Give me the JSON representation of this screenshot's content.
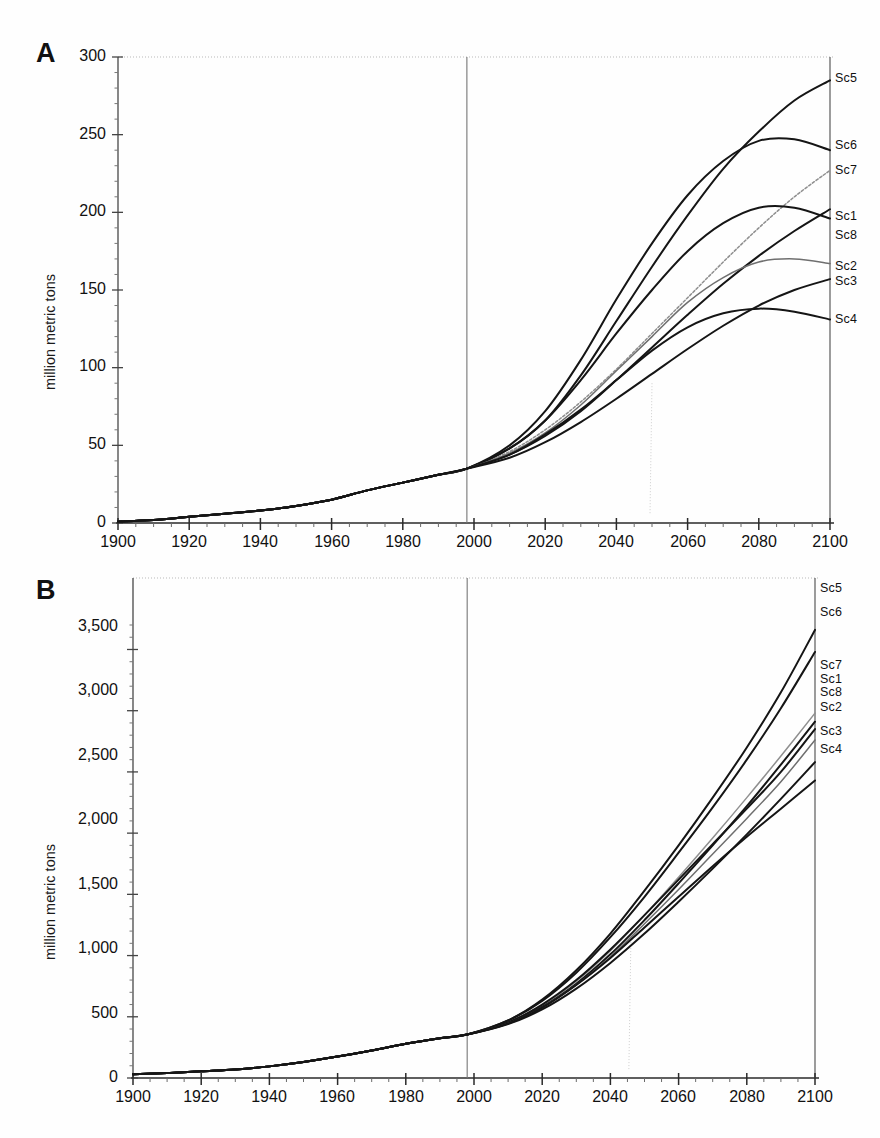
{
  "figure": {
    "panels": [
      {
        "letter": "A",
        "ylabel": "million metric tons",
        "yticks": [
          "0",
          "50",
          "100",
          "150",
          "200",
          "250",
          "300"
        ],
        "xticks": [
          "1900",
          "1920",
          "1940",
          "1960",
          "1980",
          "2000",
          "2020",
          "2040",
          "2060",
          "2080",
          "2100"
        ],
        "series_labels": [
          "Sc5",
          "Sc6",
          "Sc7",
          "Sc1",
          "Sc8",
          "Sc2",
          "Sc3",
          "Sc4"
        ]
      },
      {
        "letter": "B",
        "ylabel": "million metric tons",
        "yticks": [
          "0",
          "500",
          "1,000",
          "1,500",
          "2,000",
          "2,500",
          "3,000",
          "3,500"
        ],
        "xticks": [
          "1900",
          "1920",
          "1940",
          "1960",
          "1980",
          "2000",
          "2020",
          "2040",
          "2060",
          "2080",
          "2100"
        ],
        "series_labels": [
          "Sc5",
          "Sc6",
          "Sc7",
          "Sc1",
          "Sc8",
          "Sc2",
          "Sc3",
          "Sc4"
        ]
      }
    ]
  },
  "chart_data": [
    {
      "type": "line",
      "panel": "A",
      "title": "",
      "xlabel": "",
      "ylabel": "million metric tons",
      "xlim": [
        1900,
        2100
      ],
      "ylim": [
        0,
        300
      ],
      "ytick_values": [
        0,
        50,
        100,
        150,
        200,
        250,
        300
      ],
      "xtick_values": [
        1900,
        1920,
        1940,
        1960,
        1980,
        2000,
        2020,
        2040,
        2060,
        2080,
        2100
      ],
      "minor_tick_interval": 5,
      "grid": false,
      "legend_position": "right-end-of-line",
      "annotations": [
        {
          "text": "vertical reference line at base year",
          "x": 1998
        }
      ],
      "x": [
        1900,
        1910,
        1920,
        1930,
        1940,
        1950,
        1960,
        1970,
        1980,
        1990,
        1998,
        2010,
        2020,
        2030,
        2040,
        2050,
        2060,
        2070,
        2080,
        2090,
        2100
      ],
      "series": [
        {
          "name": "Sc5",
          "values": [
            1,
            2,
            4,
            6,
            8,
            11,
            15,
            21,
            26,
            31,
            35,
            48,
            66,
            95,
            130,
            165,
            198,
            228,
            252,
            272,
            285
          ]
        },
        {
          "name": "Sc6",
          "values": [
            1,
            2,
            4,
            6,
            8,
            11,
            15,
            21,
            26,
            31,
            35,
            50,
            72,
            105,
            144,
            180,
            211,
            233,
            246,
            247,
            240
          ]
        },
        {
          "name": "Sc7",
          "values": [
            1,
            2,
            4,
            6,
            8,
            11,
            15,
            21,
            26,
            31,
            35,
            46,
            60,
            78,
            99,
            122,
            145,
            168,
            190,
            210,
            227
          ]
        },
        {
          "name": "Sc1",
          "values": [
            1,
            2,
            4,
            6,
            8,
            11,
            15,
            21,
            26,
            31,
            35,
            44,
            56,
            72,
            92,
            113,
            134,
            154,
            172,
            188,
            202
          ]
        },
        {
          "name": "Sc8",
          "values": [
            1,
            2,
            4,
            6,
            8,
            11,
            15,
            21,
            26,
            31,
            35,
            48,
            66,
            92,
            122,
            150,
            175,
            193,
            203,
            203,
            196
          ]
        },
        {
          "name": "Sc2",
          "values": [
            1,
            2,
            4,
            6,
            8,
            11,
            15,
            21,
            26,
            31,
            35,
            45,
            58,
            76,
            98,
            120,
            142,
            158,
            168,
            170,
            167
          ]
        },
        {
          "name": "Sc3",
          "values": [
            1,
            2,
            4,
            6,
            8,
            11,
            15,
            21,
            26,
            31,
            35,
            42,
            52,
            65,
            80,
            96,
            112,
            127,
            140,
            150,
            157
          ]
        },
        {
          "name": "Sc4",
          "values": [
            1,
            2,
            4,
            6,
            8,
            11,
            15,
            21,
            26,
            31,
            35,
            44,
            57,
            73,
            92,
            111,
            126,
            135,
            138,
            136,
            131
          ]
        }
      ]
    },
    {
      "type": "line",
      "panel": "B",
      "title": "",
      "xlabel": "",
      "ylabel": "million metric tons",
      "xlim": [
        1900,
        2100
      ],
      "ylim": [
        0,
        3700
      ],
      "ytick_values": [
        0,
        500,
        1000,
        1500,
        2000,
        2500,
        3000,
        3500
      ],
      "xtick_values": [
        1900,
        1920,
        1940,
        1960,
        1980,
        2000,
        2020,
        2040,
        2060,
        2080,
        2100
      ],
      "minor_tick_interval": 5,
      "grid": false,
      "legend_position": "right-end-of-line",
      "annotations": [
        {
          "text": "vertical reference line at base year",
          "x": 1998
        }
      ],
      "x": [
        1900,
        1910,
        1920,
        1930,
        1940,
        1950,
        1960,
        1970,
        1980,
        1990,
        1998,
        2010,
        2020,
        2030,
        2040,
        2050,
        2060,
        2070,
        2080,
        2090,
        2100
      ],
      "series": [
        {
          "name": "Sc5",
          "values": [
            30,
            40,
            55,
            70,
            95,
            130,
            175,
            225,
            280,
            325,
            355,
            470,
            640,
            880,
            1180,
            1530,
            1900,
            2290,
            2700,
            3150,
            3660
          ]
        },
        {
          "name": "Sc6",
          "values": [
            30,
            40,
            55,
            70,
            95,
            130,
            175,
            225,
            280,
            325,
            355,
            470,
            630,
            860,
            1150,
            1480,
            1840,
            2210,
            2600,
            3020,
            3480
          ]
        },
        {
          "name": "Sc7",
          "values": [
            30,
            40,
            55,
            70,
            95,
            130,
            175,
            225,
            280,
            325,
            355,
            450,
            590,
            790,
            1040,
            1330,
            1640,
            1960,
            2290,
            2630,
            2980
          ]
        },
        {
          "name": "Sc1",
          "values": [
            30,
            40,
            55,
            70,
            95,
            130,
            175,
            225,
            280,
            325,
            355,
            450,
            580,
            770,
            1010,
            1290,
            1590,
            1900,
            2220,
            2560,
            2910
          ]
        },
        {
          "name": "Sc8",
          "values": [
            30,
            40,
            55,
            70,
            95,
            130,
            175,
            225,
            280,
            325,
            355,
            455,
            600,
            800,
            1050,
            1330,
            1620,
            1910,
            2200,
            2500,
            2850
          ]
        },
        {
          "name": "Sc2",
          "values": [
            30,
            40,
            55,
            70,
            95,
            130,
            175,
            225,
            280,
            325,
            355,
            445,
            575,
            760,
            990,
            1260,
            1540,
            1830,
            2120,
            2420,
            2760
          ]
        },
        {
          "name": "Sc3",
          "values": [
            30,
            40,
            55,
            70,
            95,
            130,
            175,
            225,
            280,
            325,
            355,
            440,
            560,
            730,
            940,
            1180,
            1440,
            1710,
            1990,
            2280,
            2580
          ]
        },
        {
          "name": "Sc4",
          "values": [
            30,
            40,
            55,
            70,
            95,
            130,
            175,
            225,
            280,
            325,
            355,
            445,
            575,
            760,
            980,
            1230,
            1480,
            1730,
            1970,
            2200,
            2430
          ]
        }
      ]
    }
  ]
}
